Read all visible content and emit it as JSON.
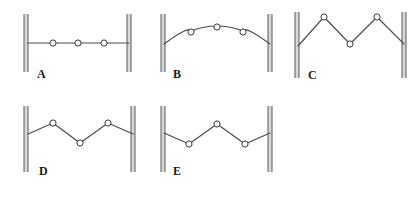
{
  "figure": {
    "title": "",
    "background_color": "#ffffff",
    "line_color": "#4a4a4a",
    "wall_color": "#5a5a5a",
    "wall_fill": "#d8d8d8",
    "bead_fill": "#ffffff",
    "bead_stroke": "#3a3a3a",
    "label_color": "#1a1a1a",
    "bead_radius": 3.1,
    "wall_width": 4,
    "panel_count": 5
  },
  "panels": [
    {
      "id": "A",
      "label": "A",
      "label_x": 37,
      "label_y": 78,
      "shape": "flat",
      "walls": {
        "left_x": 26,
        "right_x": 129,
        "top_y": 14,
        "bottom_y": 72
      },
      "string_path": "M 28 43 L 129 43",
      "anchor_left": {
        "x": 28,
        "y": 43
      },
      "anchor_right": {
        "x": 129,
        "y": 43
      },
      "beads": [
        {
          "x": 53,
          "y": 43
        },
        {
          "x": 78,
          "y": 43
        },
        {
          "x": 104,
          "y": 43
        }
      ]
    },
    {
      "id": "B",
      "label": "B",
      "label_x": 173,
      "label_y": 78,
      "shape": "arc-up",
      "walls": {
        "left_x": 163,
        "right_x": 270,
        "top_y": 14,
        "bottom_y": 72
      },
      "string_path": "M 164 44 Q 190 25 191 31 Q 217 21 243 31 Q 244 25 270 44",
      "anchor_left": {
        "x": 164,
        "y": 44
      },
      "anchor_right": {
        "x": 270,
        "y": 44
      },
      "beads": [
        {
          "x": 191,
          "y": 32
        },
        {
          "x": 217,
          "y": 27
        },
        {
          "x": 243,
          "y": 32
        }
      ]
    },
    {
      "id": "C",
      "label": "C",
      "label_x": 308,
      "label_y": 79,
      "shape": "zigzag-up-down-up",
      "walls": {
        "left_x": 297,
        "right_x": 404,
        "top_y": 12,
        "bottom_y": 78
      },
      "string_path": "M 298 46 L 324 17 L 350 44 L 377 17 L 404 44",
      "anchor_left": {
        "x": 298,
        "y": 46
      },
      "anchor_right": {
        "x": 404,
        "y": 44
      },
      "beads": [
        {
          "x": 324,
          "y": 17
        },
        {
          "x": 350,
          "y": 44
        },
        {
          "x": 377,
          "y": 17
        }
      ]
    },
    {
      "id": "D",
      "label": "D",
      "label_x": 39,
      "label_y": 175,
      "shape": "zigzag-up-down-up-shallow",
      "walls": {
        "left_x": 26,
        "right_x": 133,
        "top_y": 106,
        "bottom_y": 172
      },
      "string_path": "M 28 134 L 53 123 L 80 143 L 108 123 L 133 134",
      "anchor_left": {
        "x": 28,
        "y": 134
      },
      "anchor_right": {
        "x": 133,
        "y": 134
      },
      "beads": [
        {
          "x": 53,
          "y": 123
        },
        {
          "x": 80,
          "y": 143
        },
        {
          "x": 108,
          "y": 123
        }
      ]
    },
    {
      "id": "E",
      "label": "E",
      "label_x": 173,
      "label_y": 175,
      "shape": "zigzag-down-up-down",
      "walls": {
        "left_x": 163,
        "right_x": 270,
        "top_y": 106,
        "bottom_y": 172
      },
      "string_path": "M 164 133 L 189 144 L 217 124 L 245 144 L 270 133",
      "anchor_left": {
        "x": 164,
        "y": 133
      },
      "anchor_right": {
        "x": 270,
        "y": 133
      },
      "beads": [
        {
          "x": 189,
          "y": 144
        },
        {
          "x": 217,
          "y": 124
        },
        {
          "x": 245,
          "y": 144
        }
      ]
    }
  ]
}
